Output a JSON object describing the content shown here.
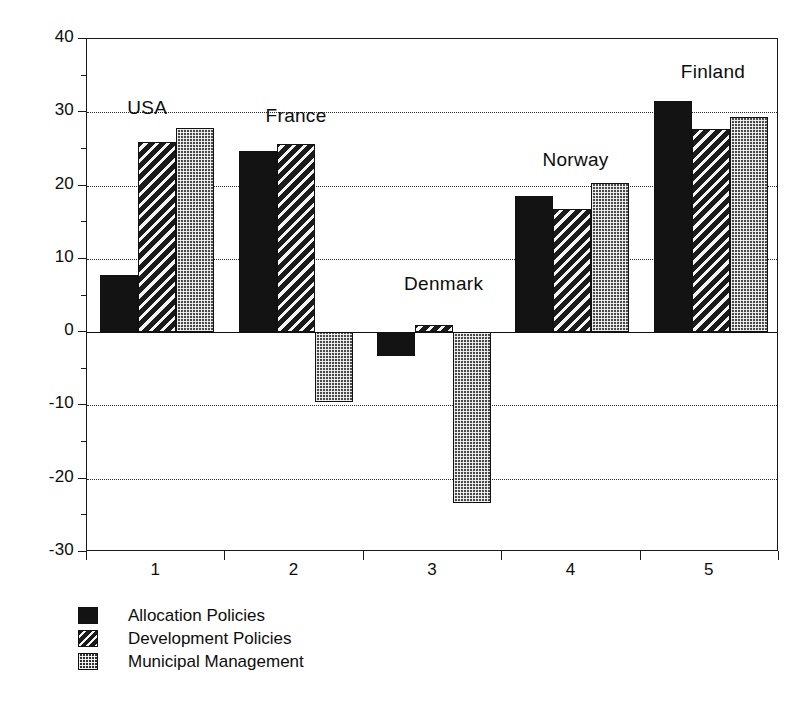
{
  "chart_data": {
    "type": "bar",
    "title": "",
    "subtitle": "",
    "xlabel": "",
    "ylabel": "",
    "ylim": [
      -30,
      40
    ],
    "y_ticks_major": [
      40,
      30,
      20,
      10,
      0,
      -10,
      -20,
      -30
    ],
    "y_ticks_minor": [
      35,
      25,
      15,
      5,
      -5,
      -15,
      -25
    ],
    "grid": "horizontal-dotted at major ticks",
    "legend_position": "below-plot-left",
    "categories": [
      "1",
      "2",
      "3",
      "4",
      "5"
    ],
    "category_annotations": [
      "USA",
      "France",
      "Denmark",
      "Norway",
      "Finland"
    ],
    "series": [
      {
        "name": "Allocation Policies",
        "pattern": "solid-black",
        "values": [
          7.8,
          24.7,
          -3.3,
          18.6,
          31.5
        ]
      },
      {
        "name": "Development Policies",
        "pattern": "diagonal-hatch",
        "values": [
          25.9,
          25.7,
          1.0,
          16.8,
          27.7
        ]
      },
      {
        "name": "Municipal Management",
        "pattern": "dotted-fill",
        "values": [
          27.9,
          -9.5,
          -23.3,
          20.4,
          29.4
        ]
      }
    ]
  },
  "axis": {
    "y_tick_labels": [
      "40",
      "30",
      "20",
      "10",
      "0",
      "-10",
      "-20",
      "-30"
    ],
    "x_tick_labels": [
      "1",
      "2",
      "3",
      "4",
      "5"
    ]
  },
  "annotations": {
    "labels": [
      {
        "text": "USA",
        "value_ref": 30
      },
      {
        "text": "France",
        "value_ref": 29
      },
      {
        "text": "Denmark",
        "value_ref": 6
      },
      {
        "text": "Norway",
        "value_ref": 23
      },
      {
        "text": "Finland",
        "value_ref": 35
      }
    ]
  },
  "legend": {
    "items": [
      {
        "label": "Allocation Policies",
        "pattern": "solid"
      },
      {
        "label": "Development Policies",
        "pattern": "hatch"
      },
      {
        "label": "Municipal Management",
        "pattern": "dots"
      }
    ]
  },
  "colors": {
    "series_allocation": "#131313",
    "series_development": "#1b1b1b",
    "series_municipal": "#4a4a4a",
    "axis": "#1a1a1a",
    "grid": "#2a2a2a",
    "background": "#ffffff"
  }
}
